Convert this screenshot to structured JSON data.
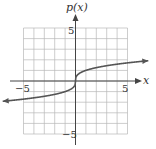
{
  "chart_data": {
    "type": "line",
    "title": "",
    "xlabel": "x",
    "ylabel": "p(x)",
    "xlim": [
      -7,
      7
    ],
    "ylim": [
      -5.5,
      5.5
    ],
    "grid": true,
    "grid_range": {
      "x": [
        -5,
        5
      ],
      "y": [
        -5,
        5
      ]
    },
    "tick_labels": {
      "x": [
        "-5",
        "5"
      ],
      "y": [
        "5",
        "-5"
      ]
    },
    "series": [
      {
        "name": "p(x)",
        "function": "cube root",
        "x": [
          -7,
          -5,
          -3,
          -1,
          -0.5,
          -0.1,
          0,
          0.1,
          0.5,
          1,
          3,
          5,
          7
        ],
        "values": [
          -1.91,
          -1.71,
          -1.44,
          -1.0,
          -0.79,
          -0.46,
          0,
          0.46,
          0.79,
          1.0,
          1.44,
          1.71,
          1.91
        ],
        "arrows_at_ends": true
      }
    ]
  },
  "labels": {
    "ylabel": "p(x)",
    "xlabel": "x",
    "x_neg": "−5",
    "x_pos": "5",
    "y_pos": "5",
    "y_neg": "−5"
  },
  "colors": {
    "grid": "#b8b8b8",
    "axis": "#444444",
    "curve": "#555555"
  }
}
